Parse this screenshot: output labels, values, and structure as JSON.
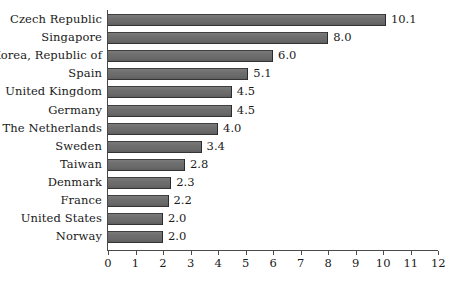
{
  "chart_data": {
    "type": "bar",
    "orientation": "horizontal",
    "title": "",
    "subtitle": "",
    "xlabel": "",
    "ylabel": "",
    "xlim": [
      0,
      12
    ],
    "grid": false,
    "legend": null,
    "bar_color": "#6a6a6a",
    "axis_color": "#4a4a4a",
    "text_color": "#1a1a1a",
    "categories": [
      "Czech Republic",
      "Singapore",
      "Korea, Republic of",
      "Spain",
      "United Kingdom",
      "Germany",
      "The Netherlands",
      "Sweden",
      "Taiwan",
      "Denmark",
      "France",
      "United States",
      "Norway"
    ],
    "values": [
      10.1,
      8.0,
      6.0,
      5.1,
      4.5,
      4.5,
      4.0,
      3.4,
      2.8,
      2.3,
      2.2,
      2.0,
      2.0
    ],
    "value_labels": [
      "10.1",
      "8.0",
      "6.0",
      "5.1",
      "4.5",
      "4.5",
      "4.0",
      "3.4",
      "2.8",
      "2.3",
      "2.2",
      "2.0",
      "2.0"
    ],
    "xticks": [
      0,
      1,
      2,
      3,
      4,
      5,
      6,
      7,
      8,
      9,
      10,
      11,
      12
    ],
    "xtick_labels": [
      "0",
      "1",
      "2",
      "3",
      "4",
      "5",
      "6",
      "7",
      "8",
      "9",
      "10",
      "11",
      "12"
    ]
  }
}
